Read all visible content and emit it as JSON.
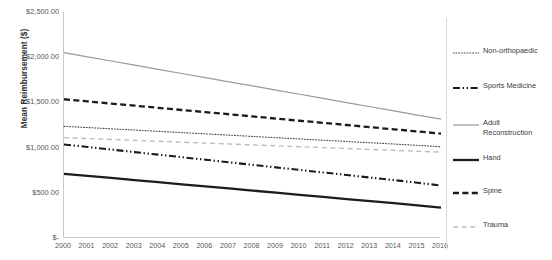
{
  "chart_data": {
    "type": "line",
    "title": "",
    "xlabel": "",
    "ylabel": "Mean Reimbursement ($)",
    "x": [
      2000,
      2001,
      2002,
      2003,
      2004,
      2005,
      2006,
      2007,
      2008,
      2009,
      2010,
      2011,
      2012,
      2013,
      2014,
      2015,
      2016
    ],
    "xtick_labels": [
      "2000",
      "2001",
      "2002",
      "2003",
      "2004",
      "2005",
      "2006",
      "2007",
      "2008",
      "2009",
      "2010",
      "2011",
      "2012",
      "2013",
      "2014",
      "2015",
      "2016"
    ],
    "ylim": [
      0,
      2500
    ],
    "ytick_values": [
      2500,
      2000,
      1500,
      1000,
      500,
      0
    ],
    "ytick_labels": [
      "$2,500.00",
      "$2,000.00",
      "$1,500.00",
      "$1,000.00",
      "$500.00",
      "$-"
    ],
    "grid": false,
    "legend_position": "right",
    "series": [
      {
        "name": "Non-orthopaedic",
        "style": "dotted",
        "color": "#4a4a4a",
        "width": 1.1,
        "values": [
          1235,
          1222,
          1208,
          1194,
          1180,
          1166,
          1152,
          1138,
          1124,
          1110,
          1096,
          1082,
          1068,
          1054,
          1040,
          1025,
          1010
        ]
      },
      {
        "name": "Sports Medicine",
        "style": "dash-dot-dot",
        "color": "#1c1c1c",
        "width": 2.1,
        "values": [
          1035,
          1007,
          979,
          950,
          922,
          894,
          866,
          838,
          809,
          781,
          753,
          725,
          697,
          668,
          640,
          612,
          580
        ]
      },
      {
        "name": "Adult Reconstruction",
        "style": "solid",
        "color": "#999999",
        "width": 1.2,
        "values": [
          2050,
          2004,
          1958,
          1912,
          1866,
          1820,
          1774,
          1728,
          1682,
          1636,
          1590,
          1544,
          1498,
          1452,
          1406,
          1360,
          1315
        ]
      },
      {
        "name": "Hand",
        "style": "solid",
        "color": "#1c1c1c",
        "width": 2.3,
        "values": [
          710,
          687,
          664,
          641,
          617,
          594,
          571,
          548,
          524,
          501,
          478,
          455,
          431,
          408,
          385,
          362,
          335
        ]
      },
      {
        "name": "Spine",
        "style": "dashed",
        "color": "#1c1c1c",
        "width": 2.3,
        "values": [
          1535,
          1511,
          1487,
          1464,
          1440,
          1416,
          1392,
          1369,
          1345,
          1321,
          1297,
          1274,
          1250,
          1226,
          1202,
          1179,
          1155
        ]
      },
      {
        "name": "Trauma",
        "style": "dashed-light",
        "color": "#bdbdbd",
        "width": 1.4,
        "values": [
          1110,
          1100,
          1090,
          1080,
          1070,
          1060,
          1050,
          1040,
          1030,
          1020,
          1010,
          1000,
          990,
          980,
          970,
          960,
          950
        ]
      }
    ],
    "legend_order": [
      "Non-orthopaedic",
      "Sports Medicine",
      "Adult Reconstruction",
      "Hand",
      "Spine",
      "Trauma"
    ]
  }
}
